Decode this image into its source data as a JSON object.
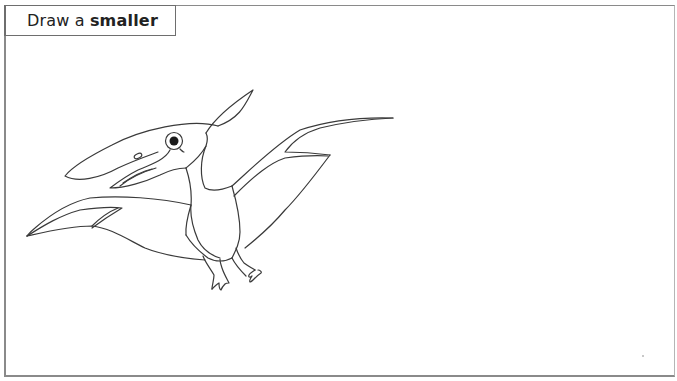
{
  "instruction": {
    "prefix": "Draw a",
    "emphasis": "smaller"
  },
  "illustration": {
    "subject": "pterodactyl",
    "style": "line-art coloring outline",
    "stroke_color": "#3a3a3a",
    "background_color": "#ffffff"
  },
  "frame": {
    "border_color": "#8a8a8a"
  }
}
